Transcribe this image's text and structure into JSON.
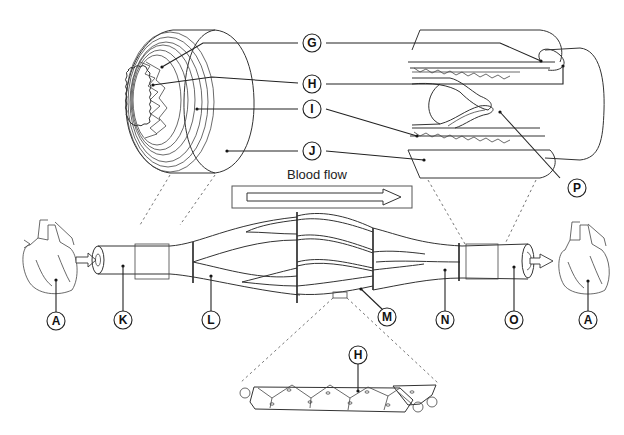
{
  "flow": {
    "label": "Blood flow",
    "direction": "left-to-right"
  },
  "labels": {
    "G": "G",
    "H": "H",
    "I": "I",
    "J": "J",
    "P": "P",
    "A_left": "A",
    "K": "K",
    "L": "L",
    "M": "M",
    "N": "N",
    "O": "O",
    "A_right": "A",
    "H_detail": "H"
  },
  "components": [
    {
      "id": "A",
      "depicts": "heart"
    },
    {
      "id": "K",
      "depicts": "artery"
    },
    {
      "id": "L",
      "depicts": "arteriole"
    },
    {
      "id": "M",
      "depicts": "capillary"
    },
    {
      "id": "N",
      "depicts": "venule"
    },
    {
      "id": "O",
      "depicts": "vein"
    },
    {
      "id": "G",
      "depicts": "vessel wall layer (lumen side)"
    },
    {
      "id": "H",
      "depicts": "endothelium"
    },
    {
      "id": "I",
      "depicts": "smooth muscle / elastic layer"
    },
    {
      "id": "J",
      "depicts": "outer connective tissue layer"
    },
    {
      "id": "P",
      "depicts": "valve"
    }
  ],
  "colors": {
    "line": "#333333",
    "background": "#ffffff",
    "label_fill": "#ffffff"
  }
}
